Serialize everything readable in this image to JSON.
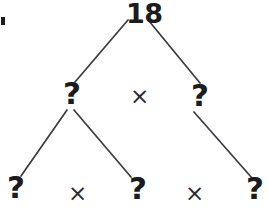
{
  "diagram": {
    "type": "factor-tree",
    "stroke_color": "#3a3a42",
    "text_color": "#1b1b20",
    "background_color": "#ffffff",
    "root": {
      "label": "18",
      "x": 140,
      "y": 10
    },
    "level2": [
      {
        "label": "?",
        "x": 71,
        "y": 96,
        "id": "m1"
      },
      {
        "label": "?",
        "x": 199,
        "y": 98,
        "id": "m2"
      }
    ],
    "level2_operators": [
      {
        "label": "×",
        "x": 138,
        "y": 96
      }
    ],
    "level3": [
      {
        "label": "?",
        "x": 15,
        "y": 191,
        "id": "b1"
      },
      {
        "label": "?",
        "x": 137,
        "y": 192,
        "id": "b2"
      },
      {
        "label": "?",
        "x": 254,
        "y": 192,
        "id": "b3"
      }
    ],
    "level3_operators": [
      {
        "label": "×",
        "x": 76,
        "y": 193
      },
      {
        "label": "×",
        "x": 193,
        "y": 193
      }
    ],
    "edges": [
      {
        "from": "18",
        "to": "m1",
        "x1": 128,
        "y1": 20,
        "x2": 75,
        "y2": 82
      },
      {
        "from": "18",
        "to": "m2",
        "x1": 149,
        "y1": 21,
        "x2": 200,
        "y2": 83
      },
      {
        "from": "m1",
        "to": "b1",
        "x1": 67,
        "y1": 110,
        "x2": 21,
        "y2": 176
      },
      {
        "from": "m1",
        "to": "b2",
        "x1": 74,
        "y1": 110,
        "x2": 131,
        "y2": 177
      },
      {
        "from": "m2",
        "to": "b3",
        "x1": 194,
        "y1": 112,
        "x2": 252,
        "y2": 178
      }
    ],
    "corner_mark": {
      "x": 1,
      "y": 17,
      "w": 4,
      "h": 8
    }
  }
}
